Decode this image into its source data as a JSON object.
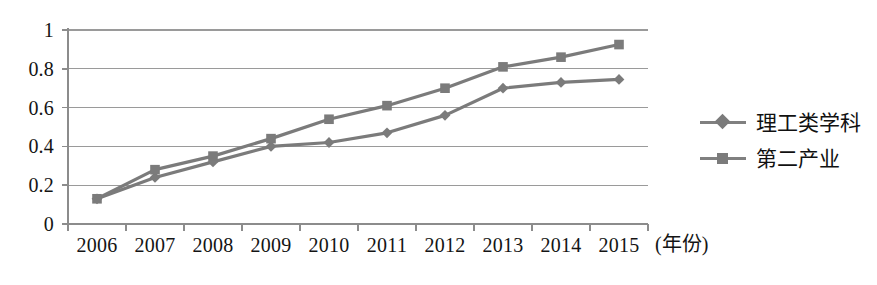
{
  "chart_data": {
    "type": "line",
    "title": "",
    "subtitle": "",
    "xlabel": "(年份)",
    "ylabel": "",
    "categories": [
      "2006",
      "2007",
      "2008",
      "2009",
      "2010",
      "2011",
      "2012",
      "2013",
      "2014",
      "2015"
    ],
    "series": [
      {
        "name": "理工类学科",
        "marker": "diamond",
        "color": "#7b7b7b",
        "values": [
          0.13,
          0.24,
          0.32,
          0.4,
          0.42,
          0.47,
          0.56,
          0.7,
          0.73,
          0.745
        ]
      },
      {
        "name": "第二产业",
        "marker": "square",
        "color": "#7b7b7b",
        "values": [
          0.13,
          0.28,
          0.35,
          0.44,
          0.54,
          0.61,
          0.7,
          0.81,
          0.86,
          0.925
        ]
      }
    ],
    "ylim": [
      0,
      1
    ],
    "yticks": [
      "0",
      "0.2",
      "0.4",
      "0.6",
      "0.8",
      "1"
    ],
    "ytick_values": [
      0,
      0.2,
      0.4,
      0.6,
      0.8,
      1
    ],
    "grid": true,
    "grid_axis": "y",
    "legend_position": "right",
    "axis_color": "#8c8c8c",
    "grid_color": "#9a9a9a",
    "background": "#ffffff"
  },
  "legend": {
    "items": [
      {
        "label": "理工类学科",
        "marker": "diamond"
      },
      {
        "label": "第二产业",
        "marker": "square"
      }
    ]
  },
  "axes": {
    "x_title": "(年份)"
  }
}
